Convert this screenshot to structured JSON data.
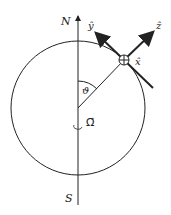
{
  "labels": {
    "north": "N",
    "south": "S",
    "theta": "ϑ",
    "omega": "Ω⃗",
    "x_hat": "x̂",
    "y_hat": "ŷ",
    "z_hat": "ẑ"
  },
  "colors": {
    "stroke": "#222222",
    "background": "#ffffff"
  }
}
